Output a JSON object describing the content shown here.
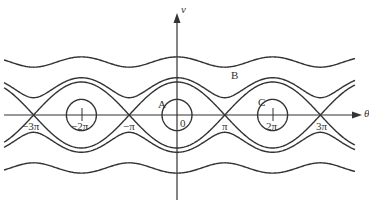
{
  "diagram": {
    "type": "phase-portrait",
    "axes": {
      "x_label": "θ",
      "y_label": "v",
      "origin_label": "0"
    },
    "tick_labels": [
      {
        "id": "neg3pi",
        "text": "−3π",
        "x_units": -3
      },
      {
        "id": "neg2pi",
        "text": "−2π",
        "x_units": -2
      },
      {
        "id": "negpi",
        "text": "−π",
        "x_units": -1
      },
      {
        "id": "pi",
        "text": "π",
        "x_units": 1
      },
      {
        "id": "twopi",
        "text": "2π",
        "x_units": 2
      },
      {
        "id": "threepi",
        "text": "3π",
        "x_units": 3
      }
    ],
    "region_labels": {
      "A": "A",
      "B": "B",
      "C": "C"
    },
    "curves": {
      "closed_orbit_centers_pi_units": [
        -2,
        0,
        2
      ],
      "saddle_points_pi_units": [
        -3,
        -1,
        1,
        3
      ],
      "levels": [
        {
          "name": "inner-orbit",
          "energy": -0.55
        },
        {
          "name": "separatrix",
          "energy": 1.0
        },
        {
          "name": "rotation-near",
          "energy": 1.55
        },
        {
          "name": "rotation-far",
          "energy": 5.2
        }
      ]
    },
    "colors": {
      "line": "#333333",
      "background": "#ffffff"
    }
  }
}
